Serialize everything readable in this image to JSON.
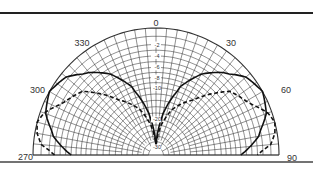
{
  "chart_data": {
    "type": "polar",
    "title": "",
    "angular_range": [
      270,
      90
    ],
    "angle_labels": [
      "270",
      "300",
      "330",
      "0",
      "30",
      "60",
      "90"
    ],
    "angle_label_values": [
      -90,
      -60,
      -30,
      0,
      30,
      60,
      90
    ],
    "radial_unit": "dB",
    "radial_labels": [
      "-2",
      "-4",
      "-6",
      "-8",
      "-10",
      "-20",
      "-30"
    ],
    "radial_label_values": [
      -2,
      -4,
      -6,
      -8,
      -10,
      -20,
      -30
    ],
    "rlim": [
      -30,
      0
    ],
    "grid": true,
    "series": [
      {
        "name": "solid pattern",
        "style": "solid",
        "angles_deg": [
          -90,
          -80,
          -70,
          -60,
          -50,
          -40,
          -30,
          -20,
          -10,
          0,
          10,
          20,
          30,
          40,
          50,
          60,
          70,
          80,
          90
        ],
        "values_db": [
          -6,
          -2.5,
          -0.7,
          0,
          -0.7,
          -2.5,
          -5,
          -9,
          -18,
          -30,
          -18,
          -9,
          -5,
          -2.5,
          -0.7,
          0,
          -0.7,
          -2.5,
          -6
        ]
      },
      {
        "name": "dashed pattern",
        "style": "dashed",
        "angles_deg": [
          -90,
          -85,
          -80,
          -75,
          -70,
          -60,
          -50,
          -45,
          -40,
          -30,
          -20,
          -10,
          0,
          10,
          20,
          30,
          40,
          45,
          50,
          60,
          70,
          75,
          80,
          85,
          90
        ],
        "values_db": [
          -3,
          -1,
          -0.3,
          0,
          -0.5,
          -2.5,
          -4,
          -6,
          -8,
          -12,
          -16,
          -22,
          -30,
          -22,
          -16,
          -12,
          -8,
          -6,
          -4,
          -2.5,
          -0.5,
          0,
          -0.3,
          -1,
          -3
        ]
      }
    ]
  }
}
